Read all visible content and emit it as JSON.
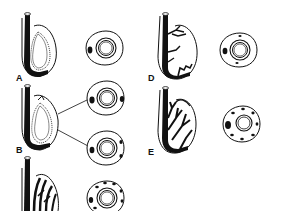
{
  "figure": {
    "type": "botanical-diagram",
    "panels": [
      {
        "id": "A",
        "label": "A",
        "cross_sections": 1,
        "bundle_pattern": "single raphe bundle"
      },
      {
        "id": "B",
        "label": "B",
        "cross_sections": 2,
        "bundle_pattern": "raphe bundle with antiraphe branch"
      },
      {
        "id": "C",
        "label": "",
        "cross_sections": 1,
        "bundle_pattern": "many longitudinal bundles"
      },
      {
        "id": "D",
        "label": "D",
        "cross_sections": 1,
        "bundle_pattern": "branched raphe bundle"
      },
      {
        "id": "E",
        "label": "E",
        "cross_sections": 1,
        "bundle_pattern": "extensively branched bundles"
      }
    ]
  },
  "colors": {
    "ink": "#111111",
    "background": "#ffffff"
  }
}
